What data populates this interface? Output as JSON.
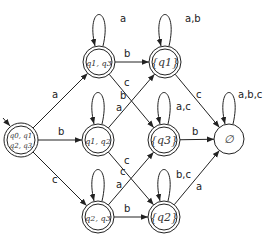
{
  "diagram": {
    "type": "DFA",
    "start_state": "s0",
    "states": [
      {
        "id": "s0",
        "label": "{q0,q1,q2,q3}",
        "line1": "q0, q1",
        "line2": "q2, q3",
        "accepting": true
      },
      {
        "id": "s13",
        "label": "{q1,q3}",
        "text": "q1, q3",
        "accepting": true
      },
      {
        "id": "s12",
        "label": "{q1,q2}",
        "text": "q1, q2",
        "accepting": true
      },
      {
        "id": "s23",
        "label": "{q2,q3}",
        "text": "q2, q3",
        "accepting": true
      },
      {
        "id": "s1",
        "label": "{q1}",
        "text": "{q1}",
        "accepting": true
      },
      {
        "id": "s3",
        "label": "{q3}",
        "text": "{q3}",
        "accepting": true
      },
      {
        "id": "s2",
        "label": "{q2}",
        "text": "{q2}",
        "accepting": true
      },
      {
        "id": "empty",
        "label": "∅",
        "text": "∅",
        "accepting": false
      }
    ],
    "transitions": [
      {
        "from": "s0",
        "to": "s13",
        "label": "a"
      },
      {
        "from": "s0",
        "to": "s12",
        "label": "b"
      },
      {
        "from": "s0",
        "to": "s23",
        "label": "c"
      },
      {
        "from": "s13",
        "to": "s13",
        "label": "a"
      },
      {
        "from": "s13",
        "to": "s1",
        "label": "b"
      },
      {
        "from": "s13",
        "to": "s3",
        "label": "c"
      },
      {
        "from": "s12",
        "to": "s12",
        "label": "b"
      },
      {
        "from": "s12",
        "to": "s1",
        "label": "a"
      },
      {
        "from": "s12",
        "to": "s2",
        "label": "c"
      },
      {
        "from": "s23",
        "to": "s23",
        "label": "c"
      },
      {
        "from": "s23",
        "to": "s3",
        "label": "a"
      },
      {
        "from": "s23",
        "to": "s2",
        "label": "b"
      },
      {
        "from": "s1",
        "to": "s1",
        "label": "a,b"
      },
      {
        "from": "s1",
        "to": "empty",
        "label": "c"
      },
      {
        "from": "s3",
        "to": "s3",
        "label": "a,c"
      },
      {
        "from": "s3",
        "to": "empty",
        "label": "b"
      },
      {
        "from": "s2",
        "to": "s2",
        "label": "b,c"
      },
      {
        "from": "s2",
        "to": "empty",
        "label": "a"
      },
      {
        "from": "empty",
        "to": "empty",
        "label": "a,b,c"
      }
    ]
  }
}
